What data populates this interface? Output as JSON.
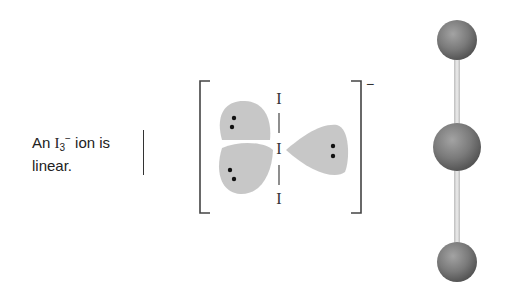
{
  "caption": {
    "prefix": "An ",
    "element": "I",
    "subscript": "3",
    "superscript": "−",
    "suffix": " ion is",
    "line2": "linear."
  },
  "lewis_structure": {
    "atoms": [
      "I",
      "I",
      "I"
    ],
    "charge": "−",
    "lone_pairs_on_central_atom": 3,
    "geometry": "linear"
  },
  "ball_and_stick": {
    "atom_count": 3,
    "atom_color": "#777777",
    "bond_color": "#d9d9d9"
  }
}
